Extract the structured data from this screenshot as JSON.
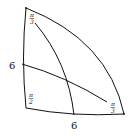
{
  "diagram": {
    "type": "curved-triangle",
    "stroke_color": "#111111",
    "background": "#ffffff",
    "angles": {
      "top": {
        "num": "π",
        "den": "3"
      },
      "bottom_left": {
        "num": "π",
        "den": "2"
      },
      "bottom_right": {
        "num": "π",
        "den": "3"
      }
    },
    "side_labels": {
      "left": "6",
      "bottom": "6"
    }
  }
}
